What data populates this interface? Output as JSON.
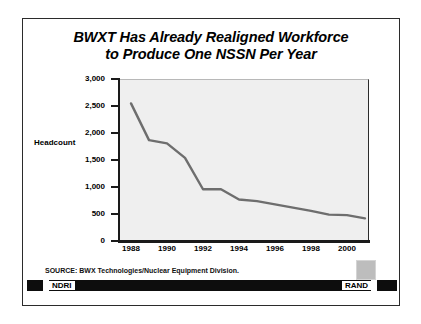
{
  "slide": {
    "title_line1": "BWXT Has Already Realigned Workforce",
    "title_line2": "to Produce One NSSN Per Year",
    "source": "SOURCE:  BWX Technologies/Nuclear Equipment Division.",
    "footer_left": "NDRI",
    "footer_right": "RAND",
    "badge_name": "rand-corner-swatch"
  },
  "colors": {
    "line": "#6e6e6e",
    "plot_background": "#efefef",
    "axis": "#1a1a1a",
    "frame": "#2b2b2b",
    "footer_bar": "#0d0d0d",
    "badge": "#bdbdbd"
  },
  "chart_data": {
    "type": "line",
    "title": "BWXT Has Already Realigned Workforce to Produce One NSSN Per Year",
    "xlabel": "",
    "ylabel": "Headcount",
    "ylim": [
      0,
      3000
    ],
    "xlim": [
      1987.5,
      2001.5
    ],
    "grid": false,
    "legend": null,
    "ytick_labels": [
      "3,000",
      "2,500",
      "2,000",
      "1,500",
      "1,000",
      "500",
      "0"
    ],
    "ytick_values": [
      3000,
      2500,
      2000,
      1500,
      1000,
      500,
      0
    ],
    "xtick_labels": [
      "1988",
      "1990",
      "1992",
      "1994",
      "1996",
      "1998",
      "2000"
    ],
    "xtick_values": [
      1988,
      1990,
      1992,
      1994,
      1996,
      1998,
      2000
    ],
    "x": [
      1988,
      1989,
      1990,
      1991,
      1992,
      1993,
      1994,
      1995,
      1996,
      1997,
      1998,
      1999,
      2000,
      2001
    ],
    "series": [
      {
        "name": "Headcount",
        "values": [
          2530,
          1850,
          1790,
          1520,
          940,
          940,
          750,
          720,
          660,
          600,
          540,
          470,
          460,
          400
        ]
      }
    ]
  }
}
